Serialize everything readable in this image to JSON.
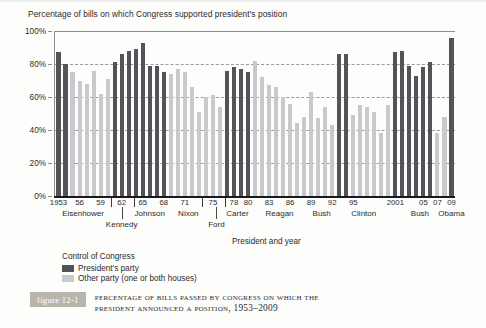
{
  "chart_data": {
    "type": "bar",
    "title": "Percentage of bills on which Congress supported president's position",
    "xlabel": "President and year",
    "ylabel": "",
    "ylim": [
      0,
      100
    ],
    "ytick_labels": [
      "0%",
      "20%",
      "40%",
      "60%",
      "80%",
      "100%"
    ],
    "ytick_values": [
      0,
      20,
      40,
      60,
      80,
      100
    ],
    "grid": true,
    "legend_position": "below-axis-left",
    "x_tick_labels": [
      "1953",
      "56",
      "59",
      "62",
      "65",
      "68",
      "71",
      "75",
      "78",
      "80",
      "83",
      "86",
      "89",
      "92",
      "95",
      "2001",
      "05",
      "07",
      "09"
    ],
    "x_tick_years": [
      1953,
      1956,
      1959,
      1962,
      1965,
      1968,
      1971,
      1975,
      1978,
      1980,
      1983,
      1986,
      1989,
      1992,
      1995,
      2001,
      2005,
      2007,
      2009
    ],
    "presidents": [
      {
        "name": "Eisenhower",
        "start": 1953,
        "end": 1960,
        "row": "top"
      },
      {
        "name": "Kennedy",
        "start": 1961,
        "end": 1963,
        "row": "bottom"
      },
      {
        "name": "Johnson",
        "start": 1964,
        "end": 1968,
        "row": "top"
      },
      {
        "name": "Nixon",
        "start": 1969,
        "end": 1974,
        "row": "top"
      },
      {
        "name": "Ford",
        "start": 1975,
        "end": 1976,
        "row": "bottom"
      },
      {
        "name": "Carter",
        "start": 1977,
        "end": 1980,
        "row": "top"
      },
      {
        "name": "Reagan",
        "start": 1981,
        "end": 1988,
        "row": "top"
      },
      {
        "name": "Bush",
        "start": 1989,
        "end": 1992,
        "row": "top"
      },
      {
        "name": "Clinton",
        "start": 1993,
        "end": 2000,
        "row": "top"
      },
      {
        "name": "Bush",
        "start": 2001,
        "end": 2008,
        "row": "top"
      },
      {
        "name": "Obama",
        "start": 2009,
        "end": 2009,
        "row": "top"
      }
    ],
    "series": [
      {
        "name": "President's party",
        "color": "#55525a"
      },
      {
        "name": "Other party (one or both houses)",
        "color": "#c9c8cc"
      }
    ],
    "years": [
      1953,
      1954,
      1955,
      1956,
      1957,
      1958,
      1959,
      1960,
      1961,
      1962,
      1963,
      1964,
      1965,
      1966,
      1967,
      1968,
      1969,
      1970,
      1971,
      1972,
      1973,
      1974,
      1975,
      1976,
      1977,
      1978,
      1979,
      1980,
      1981,
      1982,
      1983,
      1984,
      1985,
      1986,
      1987,
      1988,
      1989,
      1990,
      1991,
      1992,
      1993,
      1994,
      1995,
      1996,
      1997,
      1998,
      1999,
      2000,
      2001,
      2002,
      2003,
      2004,
      2005,
      2006,
      2007,
      2008,
      2009
    ],
    "values": [
      87,
      80,
      75,
      70,
      68,
      76,
      62,
      71,
      81,
      86,
      88,
      89,
      93,
      79,
      79,
      75,
      74,
      77,
      75,
      66,
      51,
      60,
      61,
      54,
      76,
      78,
      77,
      75,
      82,
      72,
      67,
      66,
      60,
      56,
      44,
      48,
      63,
      47,
      54,
      43,
      86,
      86,
      49,
      55,
      54,
      51,
      38,
      55,
      87,
      88,
      79,
      73,
      78,
      81,
      38,
      48,
      96
    ],
    "congress_control": [
      "own",
      "own",
      "other",
      "other",
      "other",
      "other",
      "other",
      "other",
      "own",
      "own",
      "own",
      "own",
      "own",
      "own",
      "own",
      "own",
      "other",
      "other",
      "other",
      "other",
      "other",
      "other",
      "other",
      "other",
      "own",
      "own",
      "own",
      "own",
      "other",
      "other",
      "other",
      "other",
      "other",
      "other",
      "other",
      "other",
      "other",
      "other",
      "other",
      "other",
      "own",
      "own",
      "other",
      "other",
      "other",
      "other",
      "other",
      "other",
      "own",
      "own",
      "own",
      "own",
      "own",
      "own",
      "other",
      "other",
      "own"
    ]
  },
  "legend": {
    "title": "Control of Congress",
    "items": [
      {
        "label": "President's party",
        "key": "own"
      },
      {
        "label": "Other party (one or both houses)",
        "key": "other"
      }
    ]
  },
  "figure": {
    "tag": "figure 12-1",
    "caption_line1": "Percentage of Bills Passed by Congress on Which the",
    "caption_line2": "President Announced a Position, 1953–2009"
  }
}
